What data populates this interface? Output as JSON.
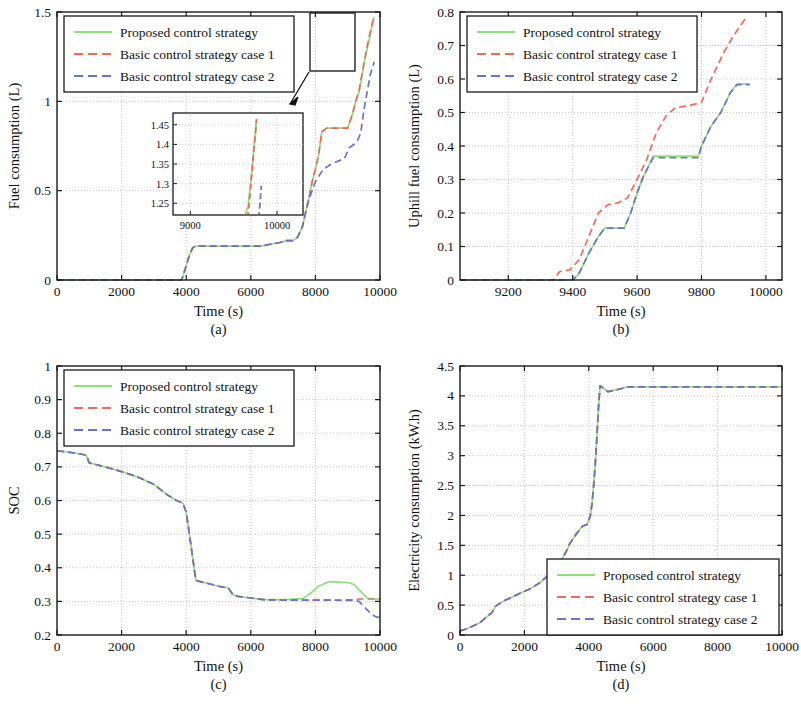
{
  "figure": {
    "panel_count": 4,
    "series_names": [
      "Proposed control strategy",
      "Basic control strategy case 1",
      "Basic control strategy case 2"
    ],
    "colors": {
      "proposed": "#8ee07a",
      "case1": "#ef6a5e",
      "case2": "#6a74c8",
      "axis": "#1a1a1a",
      "grid": "#b9b9b9"
    }
  },
  "legend": {
    "proposed": "Proposed control strategy",
    "case1": "Basic control strategy case 1",
    "case2": "Basic control strategy case 2"
  },
  "panels": {
    "a": {
      "label": "(a)",
      "xlabel": "Time (s)",
      "ylabel": "Fuel consumption (L)"
    },
    "b": {
      "label": "(b)",
      "xlabel": "Time (s)",
      "ylabel": "Uphill fuel consumption (L)"
    },
    "c": {
      "label": "(c)",
      "xlabel": "Time (s)",
      "ylabel": "SOC"
    },
    "d": {
      "label": "(d)",
      "xlabel": "Time (s)",
      "ylabel": "Electricity consumption (kW.h)"
    }
  },
  "ticks": {
    "a_x": [
      "0",
      "2000",
      "4000",
      "6000",
      "8000",
      "10000"
    ],
    "a_y": [
      "0",
      "0.5",
      "1",
      "1.5"
    ],
    "b_x": [
      "9200",
      "9400",
      "9600",
      "9800",
      "10000"
    ],
    "b_y": [
      "0",
      "0.1",
      "0.2",
      "0.3",
      "0.4",
      "0.5",
      "0.6",
      "0.7",
      "0.8"
    ],
    "c_x": [
      "0",
      "2000",
      "4000",
      "6000",
      "8000",
      "10000"
    ],
    "c_y": [
      "0.2",
      "0.3",
      "0.4",
      "0.5",
      "0.6",
      "0.7",
      "0.8",
      "0.9",
      "1"
    ],
    "d_x": [
      "0",
      "2000",
      "4000",
      "6000",
      "8000",
      "10000"
    ],
    "d_y": [
      "0",
      "0.5",
      "1",
      "1.5",
      "2",
      "2.5",
      "3",
      "3.5",
      "4",
      "4.5"
    ],
    "inset_x": [
      "9000",
      "10000"
    ],
    "inset_y": [
      "1.25",
      "1.3",
      "1.35",
      "1.4",
      "1.45"
    ]
  },
  "chart_data": [
    {
      "type": "line",
      "panel": "a",
      "title": "",
      "xlabel": "Time (s)",
      "ylabel": "Fuel consumption (L)",
      "xlim": [
        0,
        10000
      ],
      "ylim": [
        0,
        1.5
      ],
      "xticks": [
        0,
        2000,
        4000,
        6000,
        8000,
        10000
      ],
      "yticks": [
        0,
        0.5,
        1,
        1.5
      ],
      "grid": true,
      "legend_position": "top-left",
      "has_inset": true,
      "inset": {
        "xlim": [
          8800,
          10300
        ],
        "ylim": [
          1.22,
          1.48
        ],
        "xticks": [
          9000,
          10000
        ],
        "yticks": [
          1.25,
          1.3,
          1.35,
          1.4,
          1.45
        ]
      },
      "series": [
        {
          "name": "Proposed control strategy",
          "x": [
            0,
            3850,
            3900,
            4000,
            4100,
            4200,
            4300,
            5400,
            6300,
            6600,
            6900,
            7100,
            7300,
            7450,
            7600,
            7700,
            7800,
            7900,
            8000,
            8100,
            8200,
            8350,
            9000,
            9150,
            9250,
            9350,
            9450,
            9550,
            9650,
            9750,
            9820
          ],
          "y": [
            0,
            0,
            0.02,
            0.08,
            0.14,
            0.18,
            0.19,
            0.19,
            0.19,
            0.2,
            0.21,
            0.22,
            0.22,
            0.24,
            0.3,
            0.38,
            0.46,
            0.55,
            0.62,
            0.7,
            0.83,
            0.85,
            0.85,
            0.93,
            1.0,
            1.05,
            1.15,
            1.25,
            1.33,
            1.42,
            1.47
          ]
        },
        {
          "name": "Basic control strategy case 1",
          "x": [
            0,
            3850,
            3900,
            4000,
            4100,
            4200,
            4300,
            5400,
            6300,
            6600,
            6900,
            7100,
            7300,
            7450,
            7600,
            7700,
            7800,
            7900,
            8000,
            8100,
            8200,
            8350,
            9000,
            9150,
            9250,
            9350,
            9450,
            9550,
            9650,
            9750,
            9820
          ],
          "y": [
            0,
            0,
            0.02,
            0.08,
            0.14,
            0.18,
            0.19,
            0.19,
            0.19,
            0.2,
            0.21,
            0.22,
            0.22,
            0.24,
            0.3,
            0.38,
            0.46,
            0.55,
            0.62,
            0.7,
            0.83,
            0.85,
            0.85,
            0.93,
            1.0,
            1.06,
            1.16,
            1.26,
            1.35,
            1.43,
            1.48
          ]
        },
        {
          "name": "Basic control strategy case 2",
          "x": [
            0,
            3850,
            3900,
            4000,
            4100,
            4200,
            4300,
            5400,
            6300,
            6600,
            6900,
            7100,
            7300,
            7450,
            7600,
            7700,
            7800,
            7900,
            8000,
            8100,
            8250,
            8500,
            8900,
            9050,
            9200,
            9300,
            9400,
            9500,
            9600,
            9700,
            9820
          ],
          "y": [
            0,
            0,
            0.02,
            0.08,
            0.14,
            0.18,
            0.19,
            0.19,
            0.19,
            0.2,
            0.21,
            0.22,
            0.22,
            0.24,
            0.3,
            0.38,
            0.45,
            0.5,
            0.55,
            0.58,
            0.62,
            0.65,
            0.68,
            0.74,
            0.76,
            0.78,
            0.82,
            0.95,
            1.05,
            1.15,
            1.22
          ]
        }
      ]
    },
    {
      "type": "line",
      "panel": "b",
      "title": "",
      "xlabel": "Time (s)",
      "ylabel": "Uphill fuel consumption (L)",
      "xlim": [
        9050,
        10050
      ],
      "ylim": [
        0,
        0.8
      ],
      "xticks": [
        9200,
        9400,
        9600,
        9800,
        10000
      ],
      "yticks": [
        0,
        0.1,
        0.2,
        0.3,
        0.4,
        0.5,
        0.6,
        0.7,
        0.8
      ],
      "grid": true,
      "legend_position": "top-left",
      "series": [
        {
          "name": "Proposed control strategy",
          "x": [
            9050,
            9400,
            9420,
            9450,
            9480,
            9500,
            9560,
            9580,
            9600,
            9620,
            9650,
            9680,
            9790,
            9800,
            9830,
            9860,
            9890,
            9910,
            9950
          ],
          "y": [
            0,
            0,
            0.02,
            0.08,
            0.13,
            0.155,
            0.155,
            0.2,
            0.26,
            0.31,
            0.37,
            0.37,
            0.37,
            0.4,
            0.46,
            0.5,
            0.56,
            0.585,
            0.585
          ]
        },
        {
          "name": "Basic control strategy case 1",
          "x": [
            9050,
            9340,
            9360,
            9390,
            9420,
            9450,
            9480,
            9510,
            9540,
            9570,
            9600,
            9630,
            9660,
            9690,
            9720,
            9760,
            9800,
            9830,
            9870,
            9900,
            9940
          ],
          "y": [
            0,
            0,
            0.025,
            0.03,
            0.06,
            0.13,
            0.2,
            0.225,
            0.23,
            0.245,
            0.3,
            0.36,
            0.44,
            0.49,
            0.515,
            0.52,
            0.53,
            0.6,
            0.68,
            0.73,
            0.785
          ]
        },
        {
          "name": "Basic control strategy case 2",
          "x": [
            9050,
            9400,
            9420,
            9450,
            9480,
            9500,
            9560,
            9580,
            9600,
            9620,
            9650,
            9680,
            9790,
            9800,
            9830,
            9860,
            9890,
            9910,
            9950
          ],
          "y": [
            0,
            0,
            0.02,
            0.08,
            0.13,
            0.155,
            0.155,
            0.2,
            0.26,
            0.31,
            0.365,
            0.365,
            0.365,
            0.4,
            0.46,
            0.5,
            0.56,
            0.583,
            0.583
          ]
        }
      ]
    },
    {
      "type": "line",
      "panel": "c",
      "title": "",
      "xlabel": "Time (s)",
      "ylabel": "SOC",
      "xlim": [
        0,
        10000
      ],
      "ylim": [
        0.2,
        1
      ],
      "xticks": [
        0,
        2000,
        4000,
        6000,
        8000,
        10000
      ],
      "yticks": [
        0.2,
        0.3,
        0.4,
        0.5,
        0.6,
        0.7,
        0.8,
        0.9,
        1
      ],
      "grid": true,
      "legend_position": "top-left",
      "series": [
        {
          "name": "Proposed control strategy",
          "x": [
            0,
            500,
            900,
            1000,
            1200,
            1600,
            2000,
            2500,
            3000,
            3400,
            3700,
            3900,
            4000,
            4100,
            4200,
            4300,
            4600,
            5000,
            5300,
            5450,
            5600,
            6000,
            6400,
            7000,
            7600,
            7800,
            8100,
            8400,
            8600,
            9000,
            9200,
            9400,
            9600,
            9800,
            10000
          ],
          "y": [
            0.748,
            0.742,
            0.735,
            0.712,
            0.707,
            0.697,
            0.686,
            0.67,
            0.648,
            0.618,
            0.6,
            0.592,
            0.565,
            0.5,
            0.43,
            0.362,
            0.355,
            0.345,
            0.34,
            0.32,
            0.315,
            0.31,
            0.305,
            0.305,
            0.308,
            0.32,
            0.345,
            0.358,
            0.358,
            0.356,
            0.35,
            0.33,
            0.31,
            0.307,
            0.307
          ]
        },
        {
          "name": "Basic control strategy case 1",
          "x": [
            0,
            500,
            900,
            1000,
            1200,
            1600,
            2000,
            2500,
            3000,
            3400,
            3700,
            3900,
            4000,
            4100,
            4200,
            4300,
            4600,
            5000,
            5300,
            5450,
            5600,
            6000,
            6400,
            7000,
            7600,
            8200,
            8800,
            9200,
            9400,
            9600,
            9800,
            10000
          ],
          "y": [
            0.748,
            0.742,
            0.735,
            0.712,
            0.707,
            0.697,
            0.686,
            0.67,
            0.648,
            0.618,
            0.6,
            0.592,
            0.565,
            0.5,
            0.43,
            0.362,
            0.355,
            0.345,
            0.34,
            0.32,
            0.315,
            0.31,
            0.305,
            0.304,
            0.304,
            0.304,
            0.304,
            0.305,
            0.307,
            0.307,
            0.307,
            0.307
          ]
        },
        {
          "name": "Basic control strategy case 2",
          "x": [
            0,
            500,
            900,
            1000,
            1200,
            1600,
            2000,
            2500,
            3000,
            3400,
            3700,
            3900,
            4000,
            4100,
            4200,
            4300,
            4600,
            5000,
            5300,
            5450,
            5600,
            6000,
            6400,
            7000,
            7600,
            8200,
            8800,
            9200,
            9350,
            9500,
            9650,
            9800,
            9900,
            10000
          ],
          "y": [
            0.748,
            0.742,
            0.735,
            0.712,
            0.707,
            0.697,
            0.686,
            0.67,
            0.648,
            0.618,
            0.6,
            0.592,
            0.565,
            0.5,
            0.43,
            0.362,
            0.355,
            0.345,
            0.34,
            0.32,
            0.315,
            0.31,
            0.305,
            0.304,
            0.304,
            0.304,
            0.303,
            0.303,
            0.3,
            0.285,
            0.27,
            0.258,
            0.253,
            0.252
          ]
        }
      ]
    },
    {
      "type": "line",
      "panel": "d",
      "title": "",
      "xlabel": "Time (s)",
      "ylabel": "Electricity consumption (kW.h)",
      "xlim": [
        0,
        10000
      ],
      "ylim": [
        0,
        4.5
      ],
      "xticks": [
        0,
        2000,
        4000,
        6000,
        8000,
        10000
      ],
      "yticks": [
        0,
        0.5,
        1,
        1.5,
        2,
        2.5,
        3,
        3.5,
        4,
        4.5
      ],
      "grid": true,
      "legend_position": "bottom-right",
      "series": [
        {
          "name": "Proposed control strategy",
          "x": [
            0,
            200,
            600,
            1000,
            1100,
            1150,
            1400,
            1800,
            2200,
            2500,
            2700,
            2800,
            3000,
            3200,
            3350,
            3400,
            3600,
            3800,
            3950,
            4050,
            4100,
            4150,
            4200,
            4250,
            4300,
            4350,
            4600,
            5000,
            5200,
            6000,
            8000,
            10000
          ],
          "y": [
            0.07,
            0.1,
            0.2,
            0.38,
            0.48,
            0.5,
            0.58,
            0.68,
            0.78,
            0.88,
            0.98,
            1.02,
            1.12,
            1.3,
            1.45,
            1.52,
            1.68,
            1.82,
            1.85,
            2.0,
            2.2,
            2.5,
            2.85,
            3.3,
            3.8,
            4.17,
            4.07,
            4.12,
            4.15,
            4.15,
            4.15,
            4.15
          ]
        },
        {
          "name": "Basic control strategy case 1",
          "x": [
            0,
            200,
            600,
            1000,
            1100,
            1150,
            1400,
            1800,
            2200,
            2500,
            2700,
            2800,
            3000,
            3200,
            3350,
            3400,
            3600,
            3800,
            3950,
            4050,
            4100,
            4150,
            4200,
            4250,
            4300,
            4350,
            4600,
            5000,
            5200,
            6000,
            8000,
            10000
          ],
          "y": [
            0.07,
            0.1,
            0.2,
            0.38,
            0.48,
            0.5,
            0.58,
            0.68,
            0.78,
            0.88,
            0.98,
            1.02,
            1.12,
            1.3,
            1.45,
            1.52,
            1.68,
            1.82,
            1.85,
            2.0,
            2.2,
            2.5,
            2.85,
            3.3,
            3.8,
            4.17,
            4.07,
            4.12,
            4.15,
            4.15,
            4.15,
            4.15
          ]
        },
        {
          "name": "Basic control strategy case 2",
          "x": [
            0,
            200,
            600,
            1000,
            1100,
            1150,
            1400,
            1800,
            2200,
            2500,
            2700,
            2800,
            3000,
            3200,
            3350,
            3400,
            3600,
            3800,
            3950,
            4050,
            4100,
            4150,
            4200,
            4250,
            4300,
            4350,
            4600,
            5000,
            5200,
            6000,
            8000,
            10000
          ],
          "y": [
            0.07,
            0.1,
            0.2,
            0.38,
            0.48,
            0.5,
            0.58,
            0.68,
            0.78,
            0.88,
            0.98,
            1.02,
            1.12,
            1.3,
            1.45,
            1.52,
            1.68,
            1.82,
            1.85,
            2.0,
            2.2,
            2.5,
            2.85,
            3.3,
            3.8,
            4.17,
            4.07,
            4.12,
            4.15,
            4.15,
            4.15,
            4.15
          ]
        }
      ]
    }
  ]
}
